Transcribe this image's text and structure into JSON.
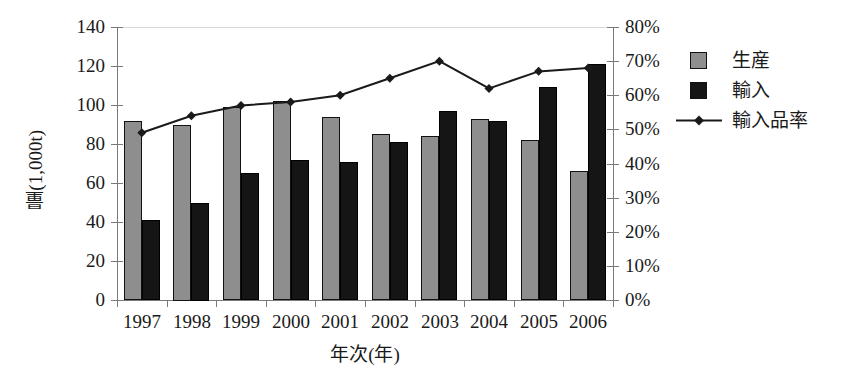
{
  "chart_data": {
    "type": "bar",
    "title": "",
    "xlabel": "年次(年)",
    "ylabel": "量(1,000t)",
    "y2label": "",
    "categories": [
      "1997",
      "1998",
      "1999",
      "2000",
      "2001",
      "2002",
      "2003",
      "2004",
      "2005",
      "2006"
    ],
    "ylim": [
      0,
      140
    ],
    "ytick_step": 20,
    "y2lim": [
      0,
      80
    ],
    "y2tick_step": 10,
    "grid": false,
    "legend_position": "right",
    "series": [
      {
        "name": "生産",
        "type": "bar",
        "axis": "left",
        "unit": "1,000t",
        "color": "#8e8e8e",
        "values": [
          92,
          90,
          99,
          102,
          94,
          85,
          84,
          93,
          82,
          66
        ]
      },
      {
        "name": "輸入",
        "type": "bar",
        "axis": "left",
        "unit": "1,000t",
        "color": "#151515",
        "values": [
          41,
          50,
          65,
          72,
          71,
          81,
          97,
          92,
          109,
          121
        ]
      },
      {
        "name": "輸入品率",
        "type": "line",
        "axis": "right",
        "unit": "%",
        "color": "#1a1a1a",
        "marker": "diamond",
        "values": [
          49,
          54,
          57,
          58,
          60,
          65,
          70,
          62,
          67,
          68
        ]
      }
    ]
  },
  "y_ticks": [
    "140",
    "120",
    "100",
    "80",
    "60",
    "40",
    "20",
    "0"
  ],
  "y2_ticks": [
    "80%",
    "70%",
    "60%",
    "50%",
    "40%",
    "30%",
    "20%",
    "10%",
    "0%"
  ],
  "legend": {
    "items": [
      {
        "label": "生産",
        "marker": "square-gray"
      },
      {
        "label": "輸入",
        "marker": "square-black"
      },
      {
        "label": "輸入品率",
        "marker": "line-diamond"
      }
    ]
  }
}
